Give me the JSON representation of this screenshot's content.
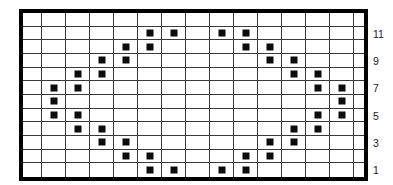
{
  "chart_data": {
    "type": "heatmap",
    "title": "",
    "grid": {
      "columns": 15,
      "rows": 12
    },
    "rows_top_to_bottom": [
      {
        "row_label": "",
        "filled_columns": []
      },
      {
        "row_label": "11",
        "filled_columns": [
          6,
          7,
          9,
          10
        ]
      },
      {
        "row_label": "",
        "filled_columns": [
          5,
          6,
          10,
          11
        ]
      },
      {
        "row_label": "9",
        "filled_columns": [
          4,
          5,
          11,
          12
        ]
      },
      {
        "row_label": "",
        "filled_columns": [
          3,
          4,
          12,
          13
        ]
      },
      {
        "row_label": "7",
        "filled_columns": [
          2,
          3,
          13,
          14
        ]
      },
      {
        "row_label": "",
        "filled_columns": [
          2,
          14
        ]
      },
      {
        "row_label": "5",
        "filled_columns": [
          2,
          3,
          13,
          14
        ]
      },
      {
        "row_label": "",
        "filled_columns": [
          3,
          4,
          12,
          13
        ]
      },
      {
        "row_label": "3",
        "filled_columns": [
          4,
          5,
          11,
          12
        ]
      },
      {
        "row_label": "",
        "filled_columns": [
          5,
          6,
          10,
          11
        ]
      },
      {
        "row_label": "1",
        "filled_columns": [
          6,
          7,
          9,
          10
        ]
      }
    ],
    "row_labels_right": [
      "11",
      "9",
      "7",
      "5",
      "3",
      "1"
    ],
    "colors": {
      "filled_square": "#0d0d0d",
      "grid_line": "#3a3a3a",
      "border": "#000000",
      "background": "#ffffff",
      "label_text": "#1a1a1a"
    }
  }
}
